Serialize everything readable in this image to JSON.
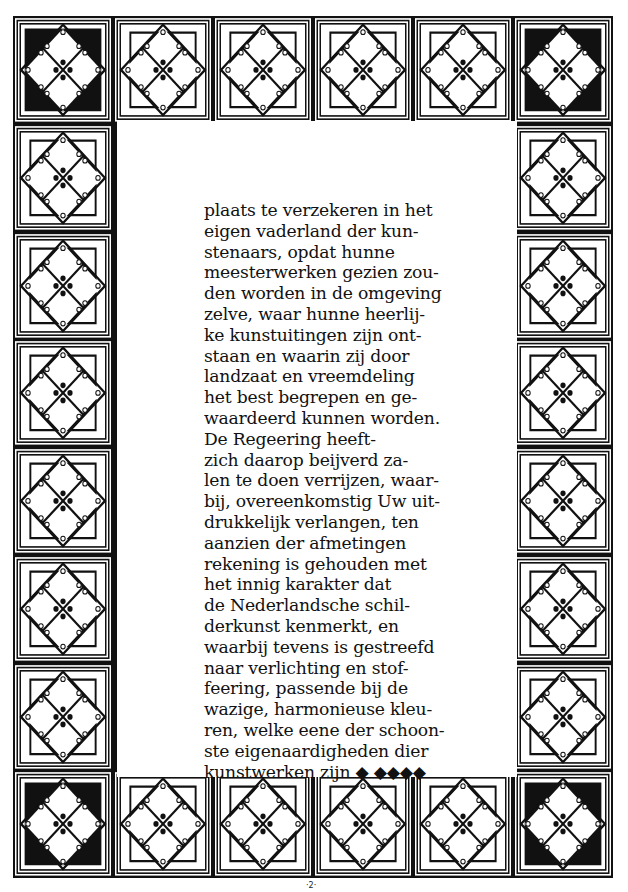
{
  "page": {
    "type": "illuminated calligraphy page with decorative lattice border",
    "colors": {
      "ink": "#111111",
      "paper": "#ffffff"
    },
    "border": {
      "columns": 6,
      "rows": 8,
      "corner_tiles": "solid black triangle corners",
      "edge_tiles": "outlined triangle corners",
      "tile_motif": "diamond lattice with circles and four-dot center"
    },
    "text_lines": [
      "plaats te verzekeren in het",
      "eigen vaderland  der kun-",
      "stenaars,  opdat  hunne",
      "meesterwerken gezien zou-",
      "den worden in de omgeving",
      "zelve, waar hunne heerlij-",
      "ke kunstuitingen zijn ont-",
      "staan en waarin zij door",
      "landzaat en vreemdeling",
      "het best begrepen en ge-",
      "waardeerd kunnen worden.",
      "   De Regeering  heeft-",
      "zich daarop beijverd za-",
      "len te doen verrijzen, waar-",
      "bij, overeenkomstig Uw uit-",
      "drukkelijk verlangen, ten",
      "aanzien der afmetingen",
      "rekening is gehouden met",
      "het innig karakter dat",
      "de Nederlandsche schil-",
      "derkunst kenmerkt, en",
      "waarbij tevens is gestreefd",
      "naar verlichting en stof-",
      "feering, passende bij de",
      "wazige, harmonieuse kleu-",
      "ren, welke eene der schoon-",
      "ste eigenaardigheden dier",
      "kunstwerken zijn ◆ ◆◆◆◆"
    ],
    "page_number": "·2·"
  }
}
